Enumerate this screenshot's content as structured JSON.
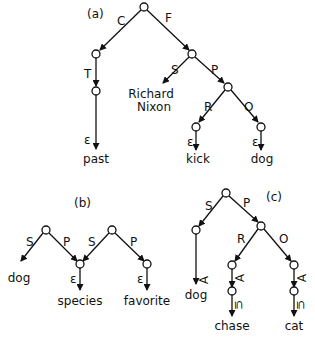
{
  "colors": {
    "ink": "#111111",
    "background": "#ffffff"
  },
  "panels": [
    {
      "id": "a",
      "label": "(a)",
      "edge_labels": {
        "C": "C",
        "F": "F",
        "T": "T",
        "S": "S",
        "P": "P",
        "R": "R",
        "O": "O",
        "eps1": "ε",
        "eps2": "ε",
        "eps3": "ε"
      },
      "leaves": {
        "past": "past",
        "richard": "Richard",
        "nixon": "Nixon",
        "kick": "kick",
        "dog": "dog"
      }
    },
    {
      "id": "b",
      "label": "(b)",
      "edge_labels": {
        "S1": "S",
        "P1": "P",
        "S2": "S",
        "P2": "P",
        "eps1": "ε",
        "eps2": "ε"
      },
      "leaves": {
        "dog": "dog",
        "species": "species",
        "favorite": "favorite"
      }
    },
    {
      "id": "c",
      "label": "(c)",
      "edge_labels": {
        "S": "S",
        "P": "P",
        "R": "R",
        "O": "O",
        "forall1": "∀",
        "forall2": "∀",
        "forall3": "∀",
        "subset1": "⊆",
        "subset2": "⊆"
      },
      "leaves": {
        "dog": "dog",
        "chase": "chase",
        "cat": "cat"
      }
    }
  ]
}
